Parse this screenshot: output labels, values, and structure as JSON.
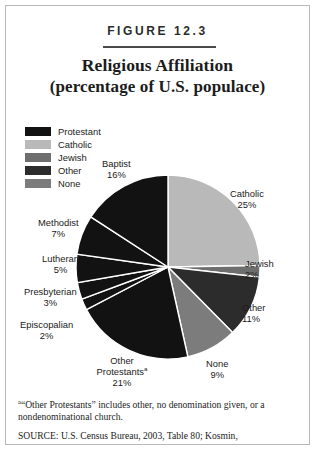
{
  "figure": {
    "number_label": "FIGURE 12.3",
    "title_line1": "Religious Affiliation",
    "title_line2": "(percentage of U.S. populace)"
  },
  "legend": {
    "items": [
      {
        "label": "Protestant",
        "color": "#121212"
      },
      {
        "label": "Catholic",
        "color": "#b9b9b9"
      },
      {
        "label": "Jewish",
        "color": "#6e6e6e"
      },
      {
        "label": "Other",
        "color": "#2c2c2c"
      },
      {
        "label": "None",
        "color": "#7c7c7c"
      }
    ]
  },
  "callouts": {
    "baptist": {
      "name": "Baptist",
      "pct": "16%"
    },
    "methodist": {
      "name": "Methodist",
      "pct": "7%"
    },
    "lutheran": {
      "name": "Lutheran",
      "pct": "5%"
    },
    "presbyterian": {
      "name": "Presbyterian",
      "pct": "3%"
    },
    "episcopalian": {
      "name": "Episcopalian",
      "pct": "2%"
    },
    "other_protestants": {
      "name": "Other",
      "name2": "Protestants",
      "marker": "a",
      "pct": "21%"
    },
    "none": {
      "name": "None",
      "pct": "9%"
    },
    "other": {
      "name": "Other",
      "pct": "11%"
    },
    "jewish": {
      "name": "Jewish",
      "pct": "2%"
    },
    "catholic": {
      "name": "Catholic",
      "pct": "25%"
    }
  },
  "footnotes": {
    "marker_a": "a",
    "note_a": "“Other Protestants” includes other, no denomination given, or a nondenominational church.",
    "source": "SOURCE:  U.S. Census Bureau, 2003, Table 80; Kosmin,"
  },
  "chart_data": {
    "type": "pie",
    "title": "Religious Affiliation (percentage of U.S. populace)",
    "unit": "percent",
    "legend_position": "upper-left",
    "start_angle_deg": 0,
    "direction": "clockwise",
    "center": {
      "x": 167,
      "y": 266
    },
    "radius": 92,
    "slices": [
      {
        "label": "Catholic",
        "value": 25,
        "color": "#b9b9b9",
        "group": "Catholic"
      },
      {
        "label": "Jewish",
        "value": 2,
        "color": "#6e6e6e",
        "group": "Jewish"
      },
      {
        "label": "Other",
        "value": 11,
        "color": "#2c2c2c",
        "group": "Other"
      },
      {
        "label": "None",
        "value": 9,
        "color": "#7c7c7c",
        "group": "None"
      },
      {
        "label": "Other Protestants",
        "value": 21,
        "color": "#121212",
        "group": "Protestant"
      },
      {
        "label": "Episcopalian",
        "value": 2,
        "color": "#121212",
        "group": "Protestant"
      },
      {
        "label": "Presbyterian",
        "value": 3,
        "color": "#121212",
        "group": "Protestant"
      },
      {
        "label": "Lutheran",
        "value": 5,
        "color": "#121212",
        "group": "Protestant"
      },
      {
        "label": "Methodist",
        "value": 7,
        "color": "#121212",
        "group": "Protestant"
      },
      {
        "label": "Baptist",
        "value": 16,
        "color": "#121212",
        "group": "Protestant"
      }
    ],
    "groups": [
      {
        "name": "Protestant",
        "value": 54
      },
      {
        "name": "Catholic",
        "value": 25
      },
      {
        "name": "Jewish",
        "value": 2
      },
      {
        "name": "Other",
        "value": 11
      },
      {
        "name": "None",
        "value": 9
      }
    ]
  }
}
